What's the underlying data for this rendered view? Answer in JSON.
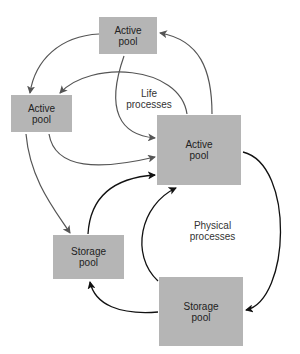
{
  "diagram": {
    "pools": [
      {
        "id": "active-top",
        "line1": "Active",
        "line2": "pool"
      },
      {
        "id": "active-left",
        "line1": "Active",
        "line2": "pool"
      },
      {
        "id": "active-center",
        "line1": "Active",
        "line2": "pool"
      },
      {
        "id": "storage-left",
        "line1": "Storage",
        "line2": "pool"
      },
      {
        "id": "storage-bottom",
        "line1": "Storage",
        "line2": "pool"
      }
    ],
    "labels": {
      "life": {
        "line1": "Life",
        "line2": "processes"
      },
      "physical": {
        "line1": "Physical",
        "line2": "processes"
      }
    },
    "colors": {
      "box": "#b5b5b5",
      "life_arrow": "#555555",
      "physical_arrow": "#111111"
    }
  }
}
